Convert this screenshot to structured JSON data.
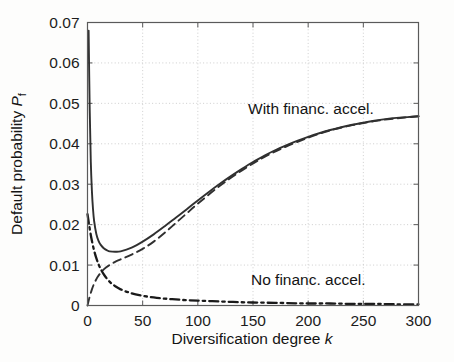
{
  "figure": {
    "background": "#fdfdfc",
    "plot_background": "#ffffff",
    "axis_color": "#5a5a5a",
    "grid_color": "#c8c8c8",
    "curve_color": "#303030"
  },
  "axes": {
    "x_title_main": "Diversification degree ",
    "x_title_var": "k",
    "y_title_main": "Default probability ",
    "y_title_var": "P",
    "y_title_sub": "f",
    "x_ticks": [
      "0",
      "50",
      "100",
      "150",
      "200",
      "250",
      "300"
    ],
    "y_ticks": [
      "0",
      "0.01",
      "0.02",
      "0.03",
      "0.04",
      "0.05",
      "0.06",
      "0.07"
    ]
  },
  "annotations": {
    "with_accel": "With financ. accel.",
    "no_accel": "No financ. accel."
  },
  "chart_data": {
    "type": "line",
    "title": "",
    "xlabel": "Diversification degree k",
    "ylabel": "Default probability P_f",
    "xlim": [
      0,
      300
    ],
    "ylim": [
      0,
      0.07
    ],
    "grid": true,
    "grid_style": "dotted",
    "legend": "inline-annotations",
    "xticks": [
      0,
      50,
      100,
      150,
      200,
      250,
      300
    ],
    "yticks": [
      0,
      0.01,
      0.02,
      0.03,
      0.04,
      0.05,
      0.06,
      0.07
    ],
    "series": [
      {
        "name": "With financ. accel.",
        "style": "solid",
        "color": "#303030",
        "annotation": "With financ. accel.",
        "x": [
          1,
          2,
          3,
          4,
          5,
          6,
          8,
          10,
          12,
          15,
          18,
          20,
          25,
          30,
          40,
          50,
          60,
          70,
          80,
          90,
          100,
          110,
          120,
          130,
          140,
          150,
          160,
          170,
          180,
          190,
          200,
          210,
          220,
          230,
          240,
          250,
          260,
          270,
          280,
          290,
          300
        ],
        "y": [
          0.068,
          0.0485,
          0.0355,
          0.0283,
          0.0238,
          0.0209,
          0.0177,
          0.016,
          0.015,
          0.0141,
          0.0136,
          0.0134,
          0.0133,
          0.0134,
          0.0143,
          0.0158,
          0.0176,
          0.0196,
          0.0217,
          0.0238,
          0.026,
          0.0281,
          0.0301,
          0.032,
          0.0338,
          0.0355,
          0.037,
          0.0384,
          0.0396,
          0.0407,
          0.0417,
          0.0426,
          0.0434,
          0.0441,
          0.0447,
          0.0452,
          0.0457,
          0.0461,
          0.0464,
          0.0466,
          0.0468
        ]
      },
      {
        "name": "Asymptotic / systematic component",
        "style": "dashed",
        "color": "#303030",
        "annotation": "",
        "x": [
          0,
          2,
          4,
          6,
          8,
          10,
          15,
          20,
          25,
          30,
          40,
          50,
          60,
          70,
          80,
          90,
          100,
          120,
          140,
          160,
          180,
          200,
          220,
          240,
          260,
          280,
          300
        ],
        "y": [
          0.0,
          0.0022,
          0.004,
          0.0054,
          0.0065,
          0.0074,
          0.009,
          0.01,
          0.0108,
          0.0114,
          0.0126,
          0.014,
          0.0158,
          0.018,
          0.0204,
          0.0228,
          0.0252,
          0.0296,
          0.0334,
          0.0367,
          0.0393,
          0.0415,
          0.0433,
          0.0446,
          0.0456,
          0.0463,
          0.0468
        ]
      },
      {
        "name": "No financ. accel.",
        "style": "dashdot",
        "color": "#1a1a1a",
        "annotation": "No financ. accel.",
        "x": [
          0,
          2,
          4,
          6,
          8,
          10,
          12,
          15,
          20,
          25,
          30,
          40,
          50,
          60,
          70,
          80,
          90,
          100,
          120,
          140,
          160,
          180,
          200,
          220,
          240,
          260,
          280,
          300
        ],
        "y": [
          0.0226,
          0.019,
          0.016,
          0.0136,
          0.0117,
          0.0102,
          0.009,
          0.0076,
          0.0059,
          0.0048,
          0.004,
          0.003,
          0.0024,
          0.002,
          0.0017,
          0.0015,
          0.0013,
          0.0012,
          0.001,
          0.0008,
          0.0007,
          0.0006,
          0.0005,
          0.0005,
          0.0004,
          0.0004,
          0.0003,
          0.0003
        ]
      }
    ]
  }
}
